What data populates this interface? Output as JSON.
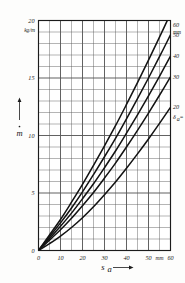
{
  "figure": {
    "kind": "line-chart",
    "background_color": "#fdfdfc",
    "ink_color": "#1b1b1b",
    "grid_color": "#5a5a5a",
    "curve_color": "#141414"
  },
  "axes": {
    "y": {
      "title_symbol": "m",
      "title_accent": "dot",
      "unit": "kg/m",
      "max_label": "20",
      "tick_labels": [
        "0",
        "5",
        "10",
        "15",
        "20"
      ],
      "tick_values": [
        0,
        5,
        10,
        15,
        20
      ],
      "minor_step": 1,
      "arrow": "up"
    },
    "x": {
      "title_symbol": "s",
      "title_subscript": "a",
      "unit": "mm",
      "tick_labels": [
        "0",
        "10",
        "20",
        "30",
        "40",
        "50",
        "60"
      ],
      "tick_values": [
        0,
        10,
        20,
        30,
        40,
        50,
        60
      ],
      "minor_step": 5,
      "arrow": "right"
    }
  },
  "legend": {
    "parameter_symbol": "δ",
    "parameter_subscript": "a",
    "parameter_suffix": "=",
    "parameter_unit": "mm",
    "entries": [
      {
        "label": "60"
      },
      {
        "label": "50"
      },
      {
        "label": "40"
      },
      {
        "label": "30"
      },
      {
        "label": "20"
      }
    ]
  },
  "chart_data": {
    "type": "line",
    "title": "",
    "subtitle": "",
    "xlabel": "s_a",
    "ylabel": "ṁ",
    "xunit": "mm",
    "yunit": "kg/m",
    "xlim": [
      0,
      60
    ],
    "ylim": [
      0,
      20
    ],
    "xticks": [
      0,
      10,
      20,
      30,
      40,
      50,
      60
    ],
    "yticks": [
      0,
      5,
      10,
      15,
      20
    ],
    "grid": true,
    "grid_minor_x_step": 5,
    "grid_minor_y_step": 1,
    "legend": "right-edge-curve-labels",
    "legend_title": "δ_a = mm",
    "x": [
      0,
      5,
      10,
      15,
      20,
      25,
      30,
      35,
      40,
      45,
      50,
      55,
      60
    ],
    "series": [
      {
        "name": "60",
        "param_value": 60,
        "values": [
          0,
          1.35,
          2.7,
          4.2,
          5.75,
          7.4,
          9.1,
          10.85,
          12.7,
          14.6,
          16.55,
          18.55,
          20.6
        ]
      },
      {
        "name": "50",
        "param_value": 50,
        "values": [
          0,
          1.2,
          2.4,
          3.7,
          5.1,
          6.6,
          8.15,
          9.75,
          11.45,
          13.2,
          15.0,
          16.85,
          18.75
        ]
      },
      {
        "name": "40",
        "param_value": 40,
        "values": [
          0,
          1.05,
          2.1,
          3.25,
          4.5,
          5.8,
          7.2,
          8.65,
          10.2,
          11.8,
          13.45,
          15.15,
          16.9
        ]
      },
      {
        "name": "30",
        "param_value": 30,
        "values": [
          0,
          0.9,
          1.8,
          2.8,
          3.9,
          5.05,
          6.3,
          7.6,
          9.0,
          10.45,
          11.95,
          13.5,
          15.1
        ]
      },
      {
        "name": "20",
        "param_value": 20,
        "values": [
          0,
          0.6,
          1.25,
          2.0,
          2.85,
          3.8,
          4.85,
          5.95,
          7.15,
          8.4,
          9.7,
          11.05,
          12.45
        ]
      }
    ]
  }
}
